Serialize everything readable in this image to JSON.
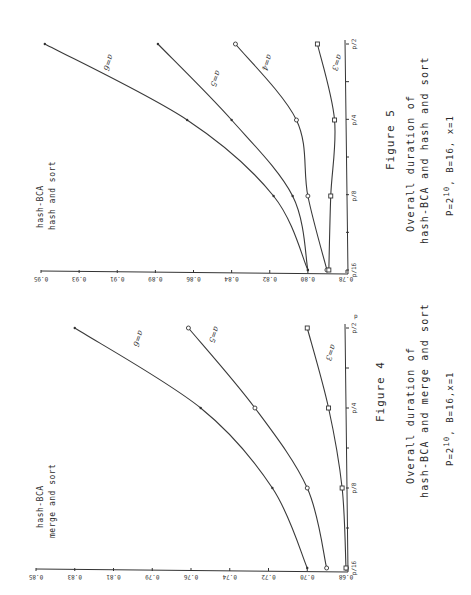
{
  "figures": [
    {
      "id": "fig5",
      "figure_label": "Figure 5",
      "ratio_numerator": "hash-BCA",
      "ratio_denominator": "hash and sort",
      "caption_line1": "Overall duration of",
      "caption_line2": "hash-BCA and hash and sort",
      "params": "P=2^10 , B=16, x=1",
      "params_base": "P=2",
      "params_exp": "10",
      "params_rest": ", B=16, x=1",
      "y_ticks": [
        "0.95",
        "0.93",
        "0.91",
        "0.89",
        "0.86",
        "0.84",
        "0.82",
        "0.80",
        "0.78"
      ],
      "x_ticks": [
        "p/16",
        "p/8",
        "p/4",
        "p/2"
      ],
      "curve_labels": [
        "a=6",
        "a=5",
        "a=4",
        "a=3"
      ]
    },
    {
      "id": "fig4",
      "figure_label": "Figure 4",
      "ratio_numerator": "hash-BCA",
      "ratio_denominator": "merge and sort",
      "caption_line1": "Overall duration of",
      "caption_line2": "hash-BCA and merge and sort",
      "params": "P=2^10 , B=16,x=1",
      "params_base": "P=2",
      "params_exp": "10",
      "params_rest": ", B=16,x=1",
      "y_ticks": [
        "0.85",
        "0.83",
        "0.81",
        "0.79",
        "0.76",
        "0.74",
        "0.72",
        "0.70",
        "0.68"
      ],
      "x_ticks": [
        "p/16",
        "p/8",
        "p/4",
        "p/2"
      ],
      "x_axis_name": "p",
      "curve_labels": [
        "a=6",
        "a=5",
        "a=3"
      ]
    }
  ],
  "chart_data": [
    {
      "type": "line",
      "title": "Figure 5: Overall duration of hash-BCA and hash and sort",
      "subtitle": "P=2^10, B=16, x=1",
      "xlabel": "p",
      "ylabel": "hash-BCA / hash and sort",
      "categories": [
        "p/16",
        "p/8",
        "p/4",
        "p/2"
      ],
      "y_tick_labels": [
        "0.78",
        "0.80",
        "0.82",
        "0.84",
        "0.86",
        "0.89",
        "0.91",
        "0.93",
        "0.95"
      ],
      "ylim": [
        0.78,
        0.95
      ],
      "orientation": "rotated 90 degrees (page printed sideways)",
      "grid": false,
      "series": [
        {
          "name": "a=6",
          "marker": "dot",
          "values": [
            0.8,
            0.818,
            0.865,
            0.948
          ]
        },
        {
          "name": "a=5",
          "marker": "dot",
          "values": [
            0.8,
            0.808,
            0.84,
            0.888
          ]
        },
        {
          "name": "a=4",
          "marker": "circle",
          "values": [
            0.79,
            0.8,
            0.806,
            0.838
          ]
        },
        {
          "name": "a=3",
          "marker": "square",
          "values": [
            0.789,
            0.788,
            0.786,
            0.795
          ]
        }
      ]
    },
    {
      "type": "line",
      "title": "Figure 4: Overall duration of hash-BCA and merge and sort",
      "subtitle": "P=2^10, B=16, x=1",
      "xlabel": "p",
      "ylabel": "hash-BCA / merge and sort",
      "categories": [
        "p/16",
        "p/8",
        "p/4",
        "p/2"
      ],
      "y_tick_labels": [
        "0.68",
        "0.70",
        "0.72",
        "0.74",
        "0.76",
        "0.79",
        "0.81",
        "0.83",
        "0.85"
      ],
      "ylim": [
        0.68,
        0.85
      ],
      "orientation": "rotated 90 degrees (page printed sideways)",
      "grid": false,
      "series": [
        {
          "name": "a=6",
          "marker": "dot",
          "values": [
            0.7,
            0.718,
            0.755,
            0.83
          ]
        },
        {
          "name": "a=5",
          "marker": "circle",
          "values": [
            0.69,
            0.7,
            0.727,
            0.762
          ]
        },
        {
          "name": "a=3",
          "marker": "square",
          "values": [
            0.68,
            0.682,
            0.689,
            0.7
          ]
        }
      ]
    }
  ]
}
